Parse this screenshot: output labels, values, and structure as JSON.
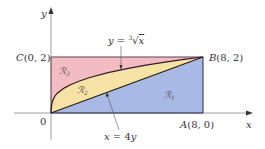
{
  "diagram": {
    "axes": {
      "x_label": "x",
      "y_label": "y",
      "origin_label": "0"
    },
    "points": {
      "A": {
        "label": "A (8, 0)",
        "x": 8,
        "y": 0
      },
      "B": {
        "label": "B (8, 2)",
        "x": 8,
        "y": 2
      },
      "C": {
        "label": "C (0, 2)",
        "x": 0,
        "y": 2
      }
    },
    "curves": {
      "cube_root": {
        "label": "y = ∛x",
        "equation": "y = x^(1/3)"
      },
      "line": {
        "label": "x = 4y",
        "equation": "x = 4y"
      }
    },
    "regions": [
      {
        "id": "R1",
        "label": "ℛ₁",
        "color": "#a9b9e6",
        "description": "below line x = 4y"
      },
      {
        "id": "R2",
        "label": "ℛ₂",
        "color": "#f6e2a4",
        "description": "between line and curve"
      },
      {
        "id": "R3",
        "label": "ℛ₃",
        "color": "#f3bcc3",
        "description": "above curve y = cube root x"
      }
    ],
    "colors": {
      "axis": "#888888",
      "boundary": "#2a2a3a"
    }
  }
}
